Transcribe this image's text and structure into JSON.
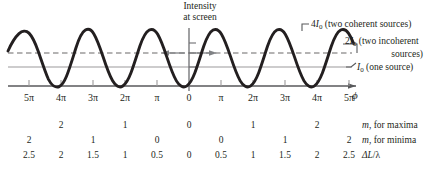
{
  "caption": {
    "line1": "Intensity",
    "line2": "at screen"
  },
  "annotations": {
    "four_i0": {
      "value": "4",
      "symbol": "I",
      "subscript": "0",
      "text": "(two coherent sources)"
    },
    "two_i0": {
      "value": "2",
      "symbol": "I",
      "subscript": "0",
      "text": "(two incoherent",
      "text_line2": "sources)"
    },
    "one_i0": {
      "value": "",
      "symbol": "I",
      "subscript": "0",
      "text": "(one source)"
    }
  },
  "axis": {
    "label": "ϕ",
    "tick_labels": [
      "5π",
      "4π",
      "3π",
      "2π",
      "π",
      "0",
      "π",
      "2π",
      "3π",
      "4π",
      "5π"
    ]
  },
  "rows": [
    {
      "name": "m-for-maxima",
      "label_italic": "m",
      "label_rest": ", for maxima",
      "values": [
        "",
        "2",
        "",
        "1",
        "",
        "0",
        "",
        "1",
        "",
        "2",
        ""
      ]
    },
    {
      "name": "m-for-minima",
      "label_italic": "m",
      "label_rest": ", for minima",
      "values": [
        "2",
        "",
        "1",
        "",
        "0",
        "",
        "0",
        "",
        "1",
        "",
        "2"
      ]
    },
    {
      "name": "path-length-difference",
      "label_italic": "ΔL",
      "label_rest": "/λ",
      "values": [
        "2.5",
        "2",
        "1.5",
        "1",
        "0.5",
        "0",
        "0.5",
        "1",
        "1.5",
        "2",
        "2.5"
      ]
    }
  ],
  "chart_data": {
    "type": "line",
    "title": "Intensity at screen",
    "xlabel": "ϕ",
    "ylabel": "Intensity",
    "x_tick_labels": [
      "5π",
      "4π",
      "3π",
      "2π",
      "π",
      "0",
      "π",
      "2π",
      "3π",
      "4π",
      "5π"
    ],
    "x_tick_values": [
      -5,
      -4,
      -3,
      -2,
      -1,
      0,
      1,
      2,
      3,
      4,
      5
    ],
    "xlim": [
      -5.6,
      5.2
    ],
    "ylim": [
      0,
      4.45
    ],
    "grid": false,
    "legend_position": "right",
    "series": [
      {
        "name": "two coherent sources",
        "style": "solid-thick",
        "color": "#231f20",
        "formula": "4*I0*cos^2(phi/2)",
        "peak_value": 4,
        "trough_value": 0,
        "maxima_at": [
          -4,
          -2,
          0,
          2,
          4
        ],
        "minima_at": [
          -5,
          -3,
          -1,
          1,
          3,
          5
        ]
      },
      {
        "name": "two incoherent sources",
        "style": "dashed",
        "color": "#9c9a9b",
        "constant_value": 2
      },
      {
        "name": "one source",
        "style": "solid-thin",
        "color": "#9c9a9b",
        "constant_value": 1
      }
    ],
    "reference_levels": [
      {
        "label": "4I0",
        "value": 4
      },
      {
        "label": "2I0",
        "value": 2
      },
      {
        "label": "I0",
        "value": 1
      },
      {
        "label": "0",
        "value": 0
      }
    ]
  }
}
